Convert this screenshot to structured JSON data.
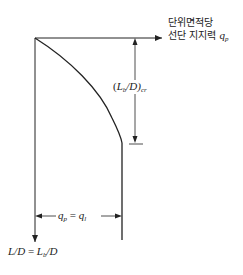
{
  "title": {
    "line1": "단위면적당",
    "line2": "선단 지지력",
    "symbol": "q",
    "symbol_sub": "p"
  },
  "dimension_vertical": {
    "open": "(",
    "L": "L",
    "L_sub": "b",
    "slash_D": "/D)",
    "sub": "cr"
  },
  "dimension_horizontal": {
    "q1": "q",
    "q1_sub": "p",
    "equals": " = ",
    "q2": "q",
    "q2_sub": "l"
  },
  "axis_label_y": {
    "lhs": "L/D",
    "equals": " = ",
    "L": "L",
    "L_sub": "b",
    "rhs": "/D"
  },
  "colors": {
    "line": "#222222",
    "background": "#ffffff"
  }
}
